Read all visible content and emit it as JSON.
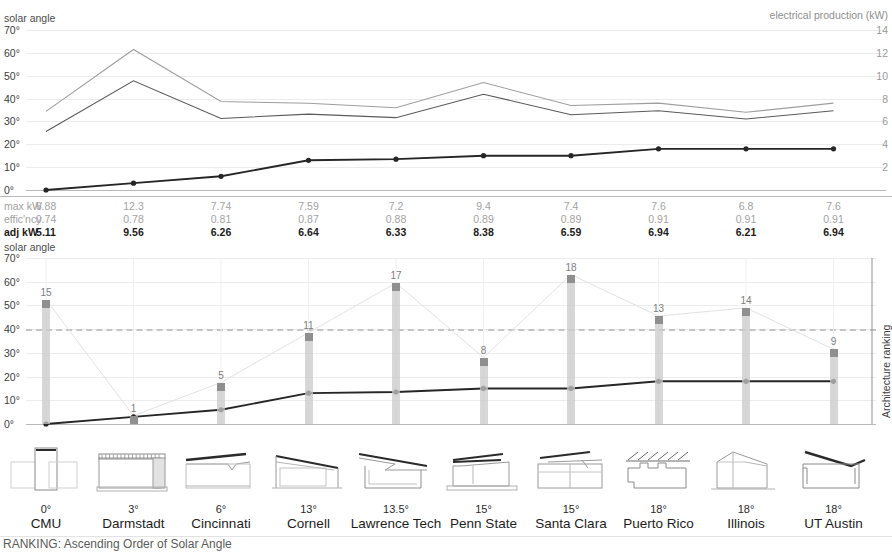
{
  "labels": {
    "left_axis_title": "solar angle",
    "right_axis_title": "electrical production (kW)",
    "rank_axis_title": "Architecture ranking",
    "footer": "RANKING: Ascending Order of Solar Angle",
    "row_max": "max kW",
    "row_eff": "effic'ncy",
    "row_adj": "adj kW"
  },
  "axis": {
    "solar_ticks": [
      "70°",
      "60°",
      "50°",
      "40°",
      "30°",
      "20°",
      "10°",
      "0°"
    ],
    "kw_ticks": [
      "14",
      "12",
      "10",
      "8",
      "6",
      "4",
      "2"
    ]
  },
  "chart_data": [
    {
      "type": "line",
      "title": "Solar angle vs electrical production",
      "xlabel": "",
      "ylabel": "solar angle",
      "y2label": "electrical production (kW)",
      "ylim": [
        0,
        70
      ],
      "y2lim": [
        0,
        14
      ],
      "grid": true,
      "categories": [
        "CMU",
        "Darmstadt",
        "Cincinnati",
        "Cornell",
        "Lawrence Tech",
        "Penn State",
        "Santa Clara",
        "Puerto Rico",
        "Illinois",
        "UT Austin"
      ],
      "series": [
        {
          "name": "max kW",
          "axis": "right",
          "color": "#9e9e9e",
          "values": [
            6.88,
            12.3,
            7.74,
            7.59,
            7.2,
            9.4,
            7.4,
            7.6,
            6.8,
            7.6
          ]
        },
        {
          "name": "adj kW",
          "axis": "right",
          "color": "#5a5a5a",
          "values": [
            5.11,
            9.56,
            6.26,
            6.64,
            6.33,
            8.38,
            6.59,
            6.94,
            6.21,
            6.94
          ]
        },
        {
          "name": "solar angle",
          "axis": "left",
          "color": "#262626",
          "markers": true,
          "values": [
            0,
            3,
            6,
            13,
            13.5,
            15,
            15,
            18,
            18,
            18
          ]
        }
      ]
    },
    {
      "type": "bar+line",
      "title": "Architecture ranking vs solar angle",
      "ylabel": "solar angle",
      "y2label": "Architecture ranking",
      "ylim": [
        0,
        70
      ],
      "grid": true,
      "reference_line": 40,
      "categories": [
        "CMU",
        "Darmstadt",
        "Cincinnati",
        "Cornell",
        "Lawrence Tech",
        "Penn State",
        "Santa Clara",
        "Puerto Rico",
        "Illinois",
        "UT Austin"
      ],
      "series": [
        {
          "name": "Architecture ranking",
          "type": "bar",
          "color": "#c9c9c9",
          "values": [
            15,
            1,
            5,
            11,
            17,
            8,
            18,
            13,
            14,
            9
          ]
        },
        {
          "name": "solar angle",
          "type": "line",
          "color": "#262626",
          "markers": true,
          "values": [
            0,
            3,
            6,
            13,
            13.5,
            15,
            15,
            18,
            18,
            18
          ]
        }
      ]
    }
  ],
  "table": {
    "columns": [
      "CMU",
      "Darmstadt",
      "Cincinnati",
      "Cornell",
      "Lawrence Tech",
      "Penn State",
      "Santa Clara",
      "Puerto Rico",
      "Illinois",
      "UT Austin"
    ],
    "max_kw": [
      "6.88",
      "12.3",
      "7.74",
      "7.59",
      "7.2",
      "9.4",
      "7.4",
      "7.6",
      "6.8",
      "7.6"
    ],
    "efficiency": [
      "0.74",
      "0.78",
      "0.81",
      "0.87",
      "0.88",
      "0.89",
      "0.89",
      "0.91",
      "0.91",
      "0.91"
    ],
    "adj_kw": [
      "5.11",
      "9.56",
      "6.26",
      "6.64",
      "6.33",
      "8.38",
      "6.59",
      "6.94",
      "6.21",
      "6.94"
    ]
  },
  "entries": [
    {
      "name": "CMU",
      "angle": "0°",
      "rank": "15",
      "icon": "section-cmu-icon"
    },
    {
      "name": "Darmstadt",
      "angle": "3°",
      "rank": "1",
      "icon": "section-darmstadt-icon"
    },
    {
      "name": "Cincinnati",
      "angle": "6°",
      "rank": "5",
      "icon": "section-cincinnati-icon"
    },
    {
      "name": "Cornell",
      "angle": "13°",
      "rank": "11",
      "icon": "section-cornell-icon"
    },
    {
      "name": "Lawrence Tech",
      "angle": "13.5°",
      "rank": "17",
      "icon": "section-lawrencetech-icon"
    },
    {
      "name": "Penn State",
      "angle": "15°",
      "rank": "8",
      "icon": "section-pennstate-icon"
    },
    {
      "name": "Santa Clara",
      "angle": "15°",
      "rank": "18",
      "icon": "section-santaclara-icon"
    },
    {
      "name": "Puerto Rico",
      "angle": "18°",
      "rank": "13",
      "icon": "section-puertorico-icon"
    },
    {
      "name": "Illinois",
      "angle": "18°",
      "rank": "14",
      "icon": "section-illinois-icon"
    },
    {
      "name": "UT Austin",
      "angle": "18°",
      "rank": "9",
      "icon": "section-utaustin-icon"
    }
  ],
  "colors": {
    "grid": "#ececec",
    "baseline": "#b9b9b9",
    "line_dark": "#262626",
    "line_mid": "#5a5a5a",
    "line_light": "#9e9e9e",
    "bar": "#c9c9c9",
    "bar_cap": "#8f8f8f",
    "muted_text": "#a2a2a2"
  }
}
